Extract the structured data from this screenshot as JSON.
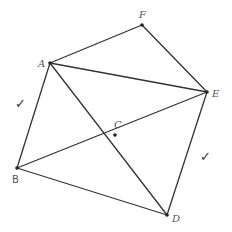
{
  "diagram": {
    "points": {
      "A": {
        "label": "A",
        "x": 50,
        "y": 63
      },
      "F": {
        "label": "F",
        "x": 142,
        "y": 25
      },
      "E": {
        "label": "E",
        "x": 207,
        "y": 92
      },
      "B": {
        "label": "B",
        "x": 17,
        "y": 168
      },
      "C": {
        "label": "C",
        "x": 115,
        "y": 135
      },
      "D": {
        "label": "D",
        "x": 167,
        "y": 215
      }
    },
    "segments": [
      "AF",
      "FE",
      "AE",
      "AB",
      "AD",
      "BE",
      "BD",
      "ED"
    ],
    "marks": {
      "left_check": "✓",
      "right_check": "✓"
    }
  }
}
